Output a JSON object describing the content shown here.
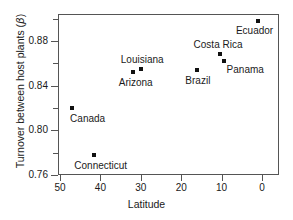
{
  "chart_data": {
    "type": "scatter",
    "title": "",
    "xlabel": "Latitude",
    "ylabel": "Turnover between host plants (β)",
    "ylabel_text": "Turnover between host plants (",
    "ylabel_symbol": "β",
    "ylabel_suffix": ")",
    "xlim": [
      50,
      0
    ],
    "ylim": [
      0.76,
      0.9
    ],
    "x_inverted": true,
    "grid": false,
    "legend": "none",
    "xticks": [
      50,
      40,
      30,
      20,
      10,
      0
    ],
    "xtick_labels": [
      "50",
      "40",
      "30",
      "20",
      "10",
      "0"
    ],
    "yticks": [
      0.76,
      0.8,
      0.84,
      0.88
    ],
    "ytick_labels": [
      "0.76",
      "0.80",
      "0.84",
      "0.88"
    ],
    "yticks_minor": [
      0.78,
      0.82,
      0.86,
      0.9
    ],
    "marker": "square",
    "marker_color": "#111111",
    "points": [
      {
        "label": "Canada",
        "x": 47.0,
        "y": 0.82,
        "label_dx": -2,
        "label_dy": 6
      },
      {
        "label": "Connecticut",
        "x": 41.5,
        "y": 0.778,
        "label_dx": -20,
        "label_dy": 6
      },
      {
        "label": "Arizona",
        "x": 32.0,
        "y": 0.852,
        "label_dx": -14,
        "label_dy": 6
      },
      {
        "label": "Louisiana",
        "x": 30.0,
        "y": 0.855,
        "label_dx": -20,
        "label_dy": -14
      },
      {
        "label": "Brazil",
        "x": 16.0,
        "y": 0.854,
        "label_dx": -12,
        "label_dy": 6
      },
      {
        "label": "Costa Rica",
        "x": 10.5,
        "y": 0.868,
        "label_dx": -26,
        "label_dy": -14
      },
      {
        "label": "Panama",
        "x": 9.5,
        "y": 0.862,
        "label_dx": 3,
        "label_dy": 4
      },
      {
        "label": "Ecuador",
        "x": 1.0,
        "y": 0.898,
        "label_dx": -22,
        "label_dy": 5
      }
    ]
  }
}
